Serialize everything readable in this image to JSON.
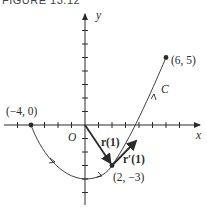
{
  "figure": {
    "title": "FIGURE 13.12",
    "axes": {
      "x_label": "x",
      "y_label": "y",
      "origin_label": "O",
      "x_ticks": [
        -6,
        -5,
        -4,
        -3,
        -2,
        -1,
        1,
        2,
        3,
        4,
        5,
        6,
        7
      ],
      "y_ticks": [
        -5,
        -4,
        -3,
        -2,
        -1,
        1,
        2,
        3,
        4,
        5,
        6,
        7,
        8
      ]
    },
    "curve": {
      "label": "C",
      "start_point": {
        "x": -4,
        "y": 0,
        "label": "(−4, 0)"
      },
      "end_point": {
        "x": 6,
        "y": 5,
        "label": "(6, 5)"
      },
      "marked_point": {
        "x": 2,
        "y": -3,
        "label": "(2, −3)"
      },
      "vertex": {
        "x": 0,
        "y": -4
      }
    },
    "vectors": [
      {
        "name": "position",
        "label": "r(1)",
        "from": [
          0,
          0
        ],
        "to": [
          2,
          -3
        ]
      },
      {
        "name": "tangent",
        "label": "r′(1)",
        "from": [
          2,
          -3
        ],
        "to": [
          4,
          -1
        ]
      }
    ],
    "colors": {
      "ink": "#2b2b2b",
      "background": "#ffffff"
    }
  }
}
